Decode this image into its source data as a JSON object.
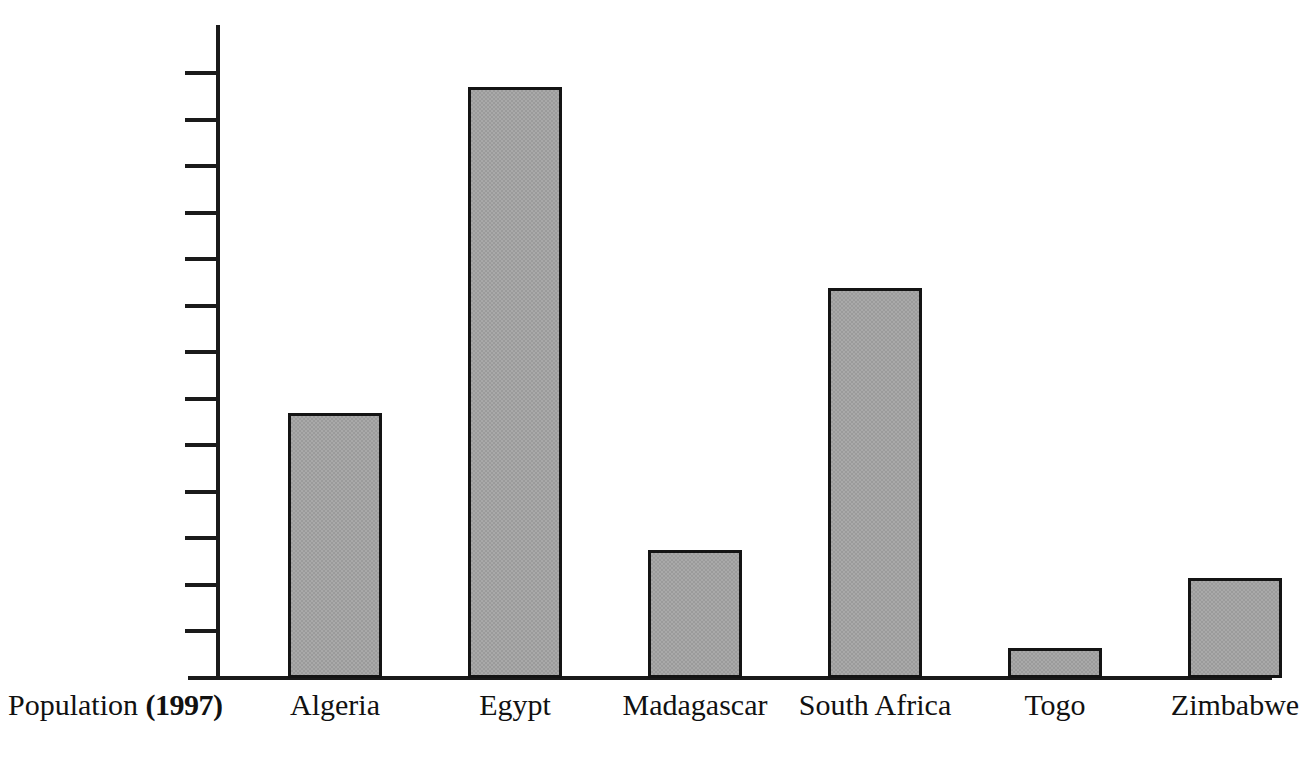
{
  "chart_data": {
    "type": "bar",
    "title": "",
    "subtitle": "",
    "xlabel": "Population (1997)",
    "ylabel": "",
    "categories": [
      "Algeria",
      "Egypt",
      "Madagascar",
      "South Africa",
      "Togo",
      "Zimbabwe"
    ],
    "values": [
      28500000,
      63500000,
      13700000,
      41900000,
      3200000,
      10700000
    ],
    "series": [
      {
        "name": "Population (1997)",
        "values": [
          28500000,
          63500000,
          13700000,
          41900000,
          3200000,
          10700000
        ]
      }
    ],
    "ylim": [
      0,
      68000000
    ],
    "ytick_values": [
      5000000,
      10000000,
      15000000,
      20000000,
      25000000,
      30000000,
      35000000,
      40000000,
      45000000,
      50000000,
      55000000,
      60000000,
      65000000
    ],
    "ytick_labels": [
      "5,000,000",
      "10,000,000",
      "15,000,000",
      "20,000,000",
      "25,000,000",
      "30,000,000",
      "35,000,000",
      "40,000,000",
      "45,000,000",
      "50,000,000",
      "55,000,000",
      "60,000,000",
      "65,000,000"
    ],
    "grid": false,
    "legend": false,
    "legend_position": "none",
    "bar_fill_color": "#a9a9a9",
    "bar_edge_color": "#141414",
    "axis_color": "#1a1a1a",
    "background_color": "#ffffff"
  },
  "caption": {
    "prefix": "Population",
    "year": "(1997)"
  }
}
